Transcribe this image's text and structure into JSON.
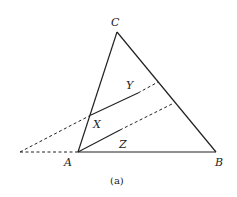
{
  "diagram": {
    "caption": "(a)",
    "colors": {
      "stroke": "#222222",
      "background": "#ffffff"
    },
    "vertices": {
      "A": {
        "label": "A",
        "x": 78,
        "y": 152
      },
      "B": {
        "label": "B",
        "x": 216,
        "y": 152
      },
      "C": {
        "label": "C",
        "x": 117,
        "y": 32
      }
    },
    "points": {
      "X": {
        "label": "X",
        "x": 91,
        "y": 115
      },
      "P": {
        "x": 20,
        "y": 152
      }
    },
    "segment_labels": {
      "Y": {
        "label": "Y"
      },
      "Z": {
        "label": "Z"
      }
    },
    "solid_segments": [
      "AB",
      "BC",
      "CA",
      "X to midpoint (Y)",
      "A to midpoint (Z)"
    ],
    "dashed_segments": [
      "P to A",
      "P to X",
      "Y segment extension to BC",
      "Z segment extension to BC"
    ]
  }
}
